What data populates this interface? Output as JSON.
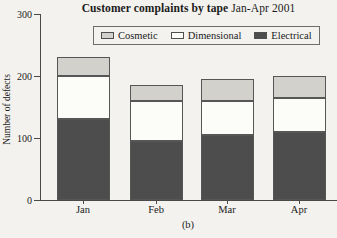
{
  "page": {
    "background": "#f3f2ee"
  },
  "chart_data": {
    "type": "bar",
    "stacked": true,
    "title_bold": "Customer complaints by tape",
    "title_regular": " Jan-Apr 2001",
    "ylabel": "Number of defects",
    "sublabel": "(b)",
    "categories": [
      "Jan",
      "Feb",
      "Mar",
      "Apr"
    ],
    "series": [
      {
        "name": "Cosmetic",
        "color": "#d2d1cc",
        "values": [
          30,
          25,
          35,
          35
        ]
      },
      {
        "name": "Dimensional",
        "color": "#fcfcf9",
        "values": [
          70,
          65,
          55,
          55
        ]
      },
      {
        "name": "Electrical",
        "color": "#4d4d4d",
        "values": [
          130,
          95,
          105,
          110
        ]
      }
    ],
    "stack_order_bottom_to_top": [
      "Electrical",
      "Dimensional",
      "Cosmetic"
    ],
    "totals": [
      230,
      185,
      195,
      200
    ],
    "yticks": [
      0,
      100,
      200,
      300
    ],
    "ylim": [
      0,
      300
    ],
    "legend_position": "top",
    "grid": false
  }
}
